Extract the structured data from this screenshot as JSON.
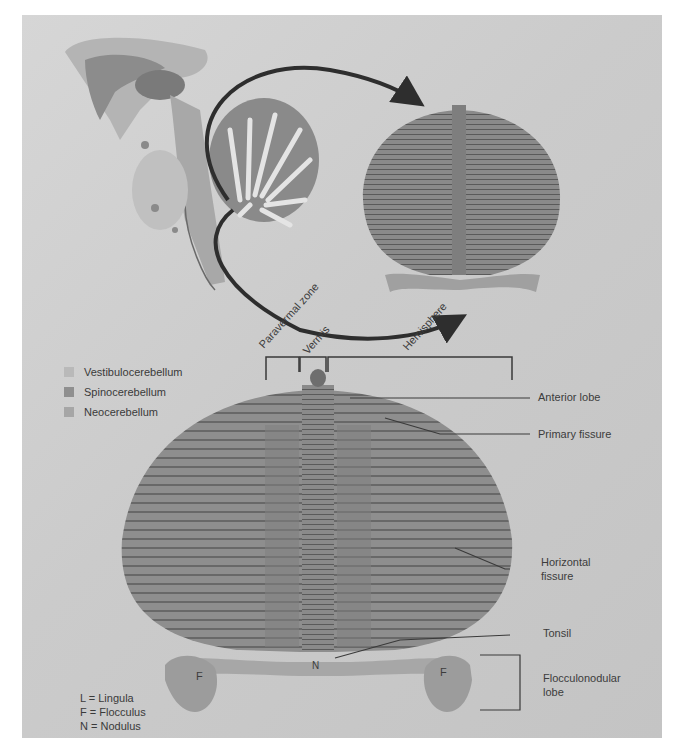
{
  "figure": {
    "zones_header": {
      "paravermal": "Paravermal zone",
      "vermis": "Vermis",
      "hemisphere": "Hemisphere"
    },
    "legend": [
      {
        "label": "Vestibulocerebellum",
        "color": "#b9b9b9"
      },
      {
        "label": "Spinocerebellum",
        "color": "#8f8f8f"
      },
      {
        "label": "Neocerebellum",
        "color": "#a6a6a6"
      }
    ],
    "right_labels": {
      "anterior_lobe": "Anterior lobe",
      "primary_fissure": "Primary fissure",
      "horizontal_fissure_1": "Horizontal",
      "horizontal_fissure_2": "fissure",
      "tonsil": "Tonsil",
      "flocculonodular_1": "Flocculonodular",
      "flocculonodular_2": "lobe"
    },
    "inline_marks": {
      "left_flocculus": "F",
      "right_flocculus": "F",
      "nodulus": "N"
    },
    "abbreviations": [
      "L = Lingula",
      "F = Flocculus",
      "N = Nodulus"
    ],
    "colors": {
      "background": "#cfcfcf",
      "tissue": "#8a8a8a",
      "arrow": "#2e2e2e"
    }
  }
}
